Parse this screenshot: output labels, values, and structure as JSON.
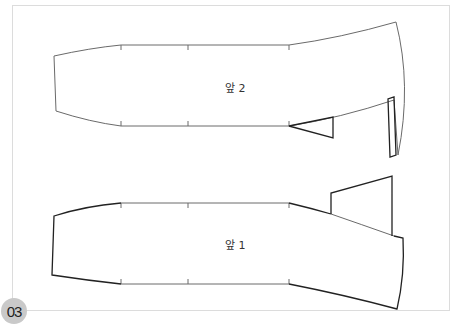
{
  "figure": {
    "badge_number": "03",
    "pieces": [
      {
        "id": "front-2",
        "label": "앞 2"
      },
      {
        "id": "front-1",
        "label": "앞 1"
      }
    ]
  },
  "colors": {
    "frame_border": "#dcdcdc",
    "outline_light": "#6a6a6a",
    "outline_dark": "#222222",
    "badge_bg": "#c9c9c9"
  }
}
